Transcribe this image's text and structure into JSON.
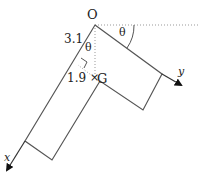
{
  "diagram": {
    "labels": {
      "origin": "O",
      "centroid": "G",
      "length_a": "3.1",
      "length_b": "1.9",
      "angle_top": "θ",
      "angle_inner": "θ",
      "axis_x": "x",
      "axis_y": "y",
      "centroid_marker": "×"
    },
    "colors": {
      "line": "#555555",
      "dotted": "#999999",
      "text": "#222222"
    }
  }
}
